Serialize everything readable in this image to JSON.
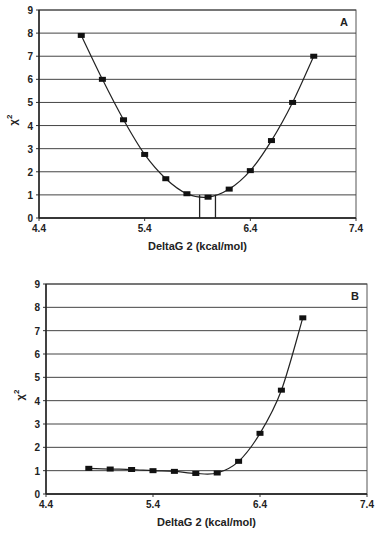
{
  "chart_data": [
    {
      "type": "line",
      "panel_label": "A",
      "title": "",
      "xlabel": "DeltaG 2 (kcal/mol)",
      "ylabel": "χ²",
      "xlim": [
        4.4,
        7.4
      ],
      "ylim": [
        0,
        9
      ],
      "x_ticks": [
        "4.4",
        "5.4",
        "6.4",
        "7.4"
      ],
      "y_ticks": [
        "0",
        "1",
        "2",
        "3",
        "4",
        "5",
        "6",
        "7",
        "8",
        "9"
      ],
      "grid": "horizontal",
      "x": [
        4.8,
        5.0,
        5.2,
        5.4,
        5.6,
        5.8,
        6.0,
        6.2,
        6.4,
        6.6,
        6.8,
        7.0
      ],
      "values": [
        7.9,
        6.0,
        4.25,
        2.75,
        1.7,
        1.05,
        0.9,
        1.25,
        2.05,
        3.35,
        5.0,
        7.0
      ],
      "annotations": [
        {
          "type": "vertical-line",
          "x": 5.92,
          "from": 0,
          "to": 1.0
        },
        {
          "type": "vertical-line",
          "x": 6.07,
          "from": 0,
          "to": 1.0
        }
      ]
    },
    {
      "type": "line",
      "panel_label": "B",
      "title": "",
      "xlabel": "DeltaG 2 (kcal/mol)",
      "ylabel": "χ²",
      "xlim": [
        4.4,
        7.4
      ],
      "ylim": [
        0,
        9
      ],
      "x_ticks": [
        "4.4",
        "5.4",
        "6.4",
        "7.4"
      ],
      "y_ticks": [
        "0",
        "1",
        "2",
        "3",
        "4",
        "5",
        "6",
        "7",
        "8",
        "9"
      ],
      "grid": "horizontal",
      "x": [
        4.8,
        5.0,
        5.2,
        5.4,
        5.6,
        5.8,
        6.0,
        6.2,
        6.4,
        6.6,
        6.8
      ],
      "values": [
        1.1,
        1.07,
        1.05,
        1.0,
        0.97,
        0.88,
        0.9,
        1.4,
        2.6,
        4.45,
        7.55
      ]
    }
  ],
  "panels": [
    {
      "label": "A",
      "xlabel": "DeltaG 2 (kcal/mol)",
      "ylabel_base": "χ",
      "ylabel_sup": "2"
    },
    {
      "label": "B",
      "xlabel": "DeltaG 2 (kcal/mol)",
      "ylabel_base": "χ",
      "ylabel_sup": "2"
    }
  ]
}
